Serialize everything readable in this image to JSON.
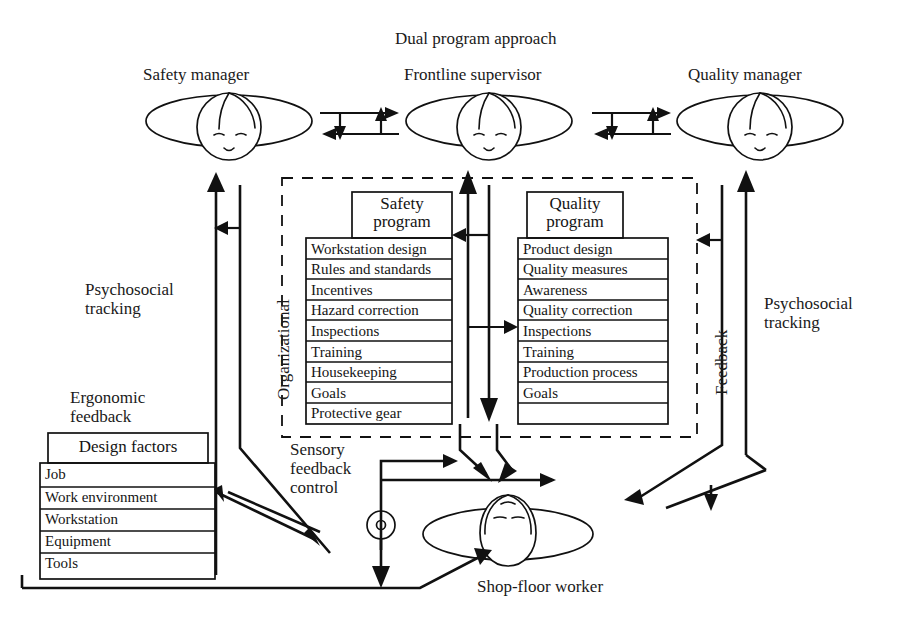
{
  "title": "Dual program approach",
  "roles": {
    "safety_manager": "Safety manager",
    "frontline_supervisor": "Frontline supervisor",
    "quality_manager": "Quality manager",
    "shop_floor_worker": "Shop-floor worker"
  },
  "side_labels": {
    "left_psychosocial": "Psychosocial\ntracking",
    "left_ergonomic": "Ergonomic\nfeedback",
    "right_psychosocial": "Psychosocial\ntracking",
    "sensory": "Sensory\nfeedback\ncontrol",
    "organizational": "Organizational",
    "feedback": "Feedback"
  },
  "safety_program": {
    "header": "Safety\nprogram",
    "items": [
      "Workstation design",
      "Rules and standards",
      "Incentives",
      "Hazard correction",
      "Inspections",
      "Training",
      "Housekeeping",
      "Goals",
      "Protective gear"
    ]
  },
  "quality_program": {
    "header": "Quality\nprogram",
    "items": [
      "Product design",
      "Quality measures",
      "Awareness",
      "Quality correction",
      "Inspections",
      "Training",
      "Production process",
      "Goals"
    ]
  },
  "design_factors": {
    "header": "Design factors",
    "items": [
      "Job",
      "Work environment",
      "Workstation",
      "Equipment",
      "Tools"
    ]
  },
  "colors": {
    "ink": "#111111",
    "background": "#ffffff"
  }
}
